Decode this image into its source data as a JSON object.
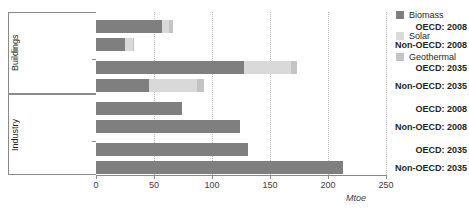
{
  "chart_data": {
    "type": "bar",
    "orientation": "horizontal",
    "stacked": true,
    "title": "",
    "xlabel": "Mtoe",
    "ylabel": "",
    "xlim": [
      0,
      250
    ],
    "xticks": [
      0,
      50,
      100,
      150,
      200,
      250
    ],
    "xtick_labels": [
      "0",
      "50",
      "100",
      "150",
      "200",
      "250"
    ],
    "grid": "vertical-dotted",
    "legend_position": "right",
    "legend": [
      "Biomass",
      "Solar",
      "Geothermal"
    ],
    "series": [
      {
        "name": "Biomass",
        "color": "#7f7f7f",
        "values": [
          57,
          25,
          128,
          46,
          74,
          124,
          131,
          213
        ]
      },
      {
        "name": "Solar",
        "color": "#d9d9d9",
        "values": [
          6,
          7,
          40,
          41,
          0,
          0,
          0,
          0
        ]
      },
      {
        "name": "Geothermal",
        "color": "#c4c4c4",
        "values": [
          3,
          1,
          5,
          6,
          0,
          0,
          0,
          0
        ]
      }
    ],
    "groups": [
      {
        "label": "Buildings",
        "categories": [
          "OECD: 2008",
          "Non-OECD: 2008",
          "OECD: 2035",
          "Non-OECD: 2035"
        ]
      },
      {
        "label": "Industry",
        "categories": [
          "OECD: 2008",
          "Non-OECD: 2008",
          "OECD: 2035",
          "Non-OECD: 2035"
        ]
      }
    ],
    "categories": [
      "Buildings OECD: 2008",
      "Buildings Non-OECD: 2008",
      "Buildings OECD: 2035",
      "Buildings Non-OECD: 2035",
      "Industry OECD: 2008",
      "Industry Non-OECD: 2008",
      "Industry OECD: 2035",
      "Industry Non-OECD: 2035"
    ]
  },
  "axis": {
    "ticks": [
      "0",
      "50",
      "100",
      "150",
      "200",
      "250"
    ],
    "unit_label": "Mtoe"
  },
  "groups": {
    "buildings": {
      "title": "Buildings",
      "rows": [
        "OECD: 2008",
        "Non-OECD: 2008",
        "OECD: 2035",
        "Non-OECD: 2035"
      ]
    },
    "industry": {
      "title": "Industry",
      "rows": [
        "OECD: 2008",
        "Non-OECD: 2008",
        "OECD: 2035",
        "Non-OECD: 2035"
      ]
    }
  },
  "legend": {
    "items": [
      {
        "label": "Biomass",
        "color": "#7f7f7f"
      },
      {
        "label": "Solar",
        "color": "#d9d9d9"
      },
      {
        "label": "Geothermal",
        "color": "#c4c4c4"
      }
    ]
  }
}
